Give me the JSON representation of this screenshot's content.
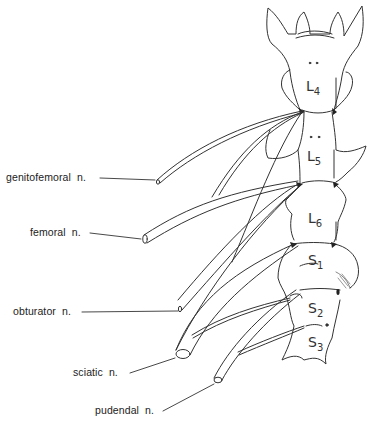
{
  "diagram": {
    "line_color": "#333333",
    "background": "#ffffff",
    "vertebrae": [
      {
        "id": "L4",
        "letter": "L",
        "index": "4"
      },
      {
        "id": "L5",
        "letter": "L",
        "index": "5"
      },
      {
        "id": "L6",
        "letter": "L",
        "index": "6"
      },
      {
        "id": "S1",
        "letter": "S",
        "index": "1"
      },
      {
        "id": "S2",
        "letter": "S",
        "index": "2"
      },
      {
        "id": "S3",
        "letter": "S",
        "index": "3"
      }
    ],
    "nerves": [
      {
        "label": "genitofemoral  n."
      },
      {
        "label": "femoral  n."
      },
      {
        "label": "obturator  n."
      },
      {
        "label": "sciatic  n."
      },
      {
        "label": "pudendal  n."
      }
    ]
  }
}
